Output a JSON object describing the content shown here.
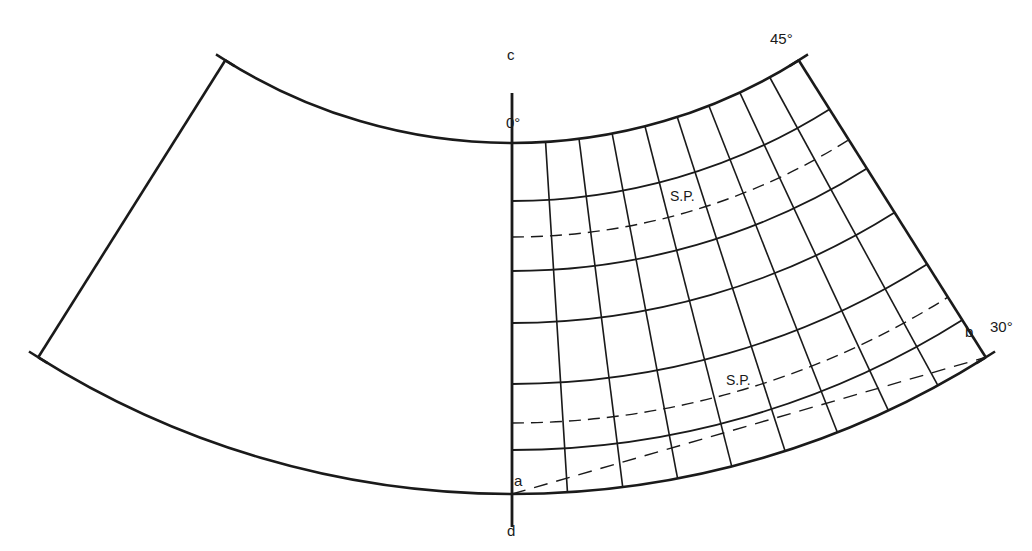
{
  "figure": {
    "type": "conic projection construction diagram",
    "ink_color": "#1a1a1a",
    "background": "#ffffff"
  },
  "labels": {
    "point_c": "c",
    "point_d": "d",
    "point_a": "a",
    "point_b": "b",
    "central_meridian_degree": "0°",
    "top_corner_degree": "45°",
    "right_corner_degree": "30°",
    "standard_parallel_upper": "S.P.",
    "standard_parallel_lower": "S.P."
  },
  "graticule": {
    "meridian_count_right_half": 9,
    "parallel_count_inner": 6,
    "standard_parallels": 2,
    "construction_line": "a to b (dashed)"
  }
}
